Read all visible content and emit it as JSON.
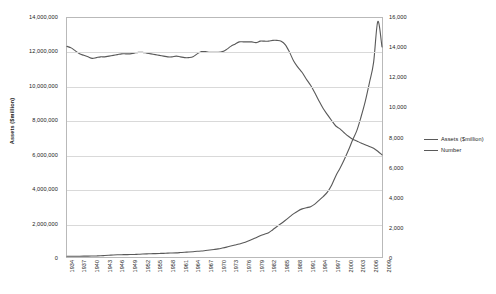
{
  "chart_data": {
    "type": "line",
    "title": "",
    "xlabel": "",
    "ylabel": "Assets ($million)",
    "y2label": "",
    "grid": true,
    "legend_position": "right",
    "ylim": [
      0,
      14000000
    ],
    "y2lim": [
      0,
      16000
    ],
    "y_ticks": [
      "0",
      "2,000,000",
      "4,000,000",
      "6,000,000",
      "8,000,000",
      "10,000,000",
      "12,000,000",
      "14,000,000"
    ],
    "y2_ticks": [
      "0",
      "2,000",
      "4,000",
      "6,000",
      "8,000",
      "10,000",
      "12,000",
      "14,000",
      "16,000"
    ],
    "x_tick_labels": [
      "1934",
      "1937",
      "1940",
      "1943",
      "1946",
      "1949",
      "1952",
      "1955",
      "1958",
      "1961",
      "1964",
      "1967",
      "1970",
      "1973",
      "1976",
      "1979",
      "1982",
      "1985",
      "1988",
      "1991",
      "1994",
      "1997",
      "2000",
      "2003",
      "2006",
      "2009"
    ],
    "x": [
      1934,
      1935,
      1936,
      1937,
      1938,
      1939,
      1940,
      1941,
      1942,
      1943,
      1944,
      1945,
      1946,
      1947,
      1948,
      1949,
      1950,
      1951,
      1952,
      1953,
      1954,
      1955,
      1956,
      1957,
      1958,
      1959,
      1960,
      1961,
      1962,
      1963,
      1964,
      1965,
      1966,
      1967,
      1968,
      1969,
      1970,
      1971,
      1972,
      1973,
      1974,
      1975,
      1976,
      1977,
      1978,
      1979,
      1980,
      1981,
      1982,
      1983,
      1984,
      1985,
      1986,
      1987,
      1988,
      1989,
      1990,
      1991,
      1992,
      1993,
      1994,
      1995,
      1996,
      1997,
      1998,
      1999,
      2000,
      2001,
      2002,
      2003,
      2004,
      2005,
      2006,
      2007,
      2008,
      2009
    ],
    "series": [
      {
        "name": "Assets ($million)",
        "axis": "left",
        "color": "#595959",
        "values": [
          40000,
          42000,
          45000,
          47000,
          49000,
          52000,
          57000,
          63000,
          72000,
          86000,
          101000,
          118000,
          130000,
          136000,
          140000,
          143000,
          150000,
          160000,
          172000,
          182000,
          191000,
          200000,
          208000,
          215000,
          228000,
          235000,
          244000,
          260000,
          276000,
          294000,
          312000,
          334000,
          350000,
          380000,
          410000,
          440000,
          475000,
          525000,
          580000,
          640000,
          700000,
          760000,
          830000,
          920000,
          1020000,
          1130000,
          1240000,
          1330000,
          1420000,
          1600000,
          1790000,
          1960000,
          2150000,
          2350000,
          2540000,
          2700000,
          2820000,
          2890000,
          2950000,
          3100000,
          3320000,
          3540000,
          3800000,
          4200000,
          4750000,
          5200000,
          5700000,
          6250000,
          6850000,
          7400000,
          8200000,
          9100000,
          10200000,
          11400000,
          13800000,
          12300000
        ]
      },
      {
        "name": "Number",
        "axis": "right",
        "color": "#595959",
        "values": [
          14100,
          14000,
          13800,
          13600,
          13500,
          13400,
          13300,
          13350,
          13400,
          13400,
          13450,
          13500,
          13550,
          13600,
          13600,
          13600,
          13650,
          13700,
          13700,
          13650,
          13600,
          13550,
          13500,
          13450,
          13400,
          13400,
          13450,
          13400,
          13350,
          13350,
          13400,
          13600,
          13750,
          13750,
          13700,
          13700,
          13700,
          13750,
          13900,
          14100,
          14250,
          14400,
          14400,
          14400,
          14400,
          14350,
          14450,
          14450,
          14450,
          14500,
          14500,
          14450,
          14200,
          13700,
          13100,
          12700,
          12350,
          11900,
          11500,
          11000,
          10450,
          9940,
          9530,
          9140,
          8770,
          8580,
          8320,
          8080,
          7890,
          7770,
          7630,
          7520,
          7400,
          7280,
          7080,
          6840
        ]
      }
    ]
  },
  "legend": {
    "items": [
      {
        "label": "Assets ($million)"
      },
      {
        "label": "Number"
      }
    ]
  },
  "colors": {
    "line": "#595959",
    "grid": "#d9d9d9",
    "axis": "#b9b9b9",
    "text": "#222222"
  }
}
